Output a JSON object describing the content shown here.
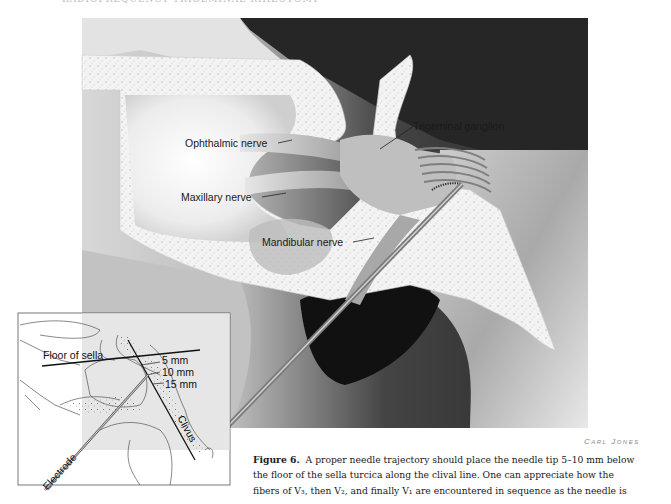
{
  "page": {
    "header_text_truncated": "RADIOFREQUENCY TRIGEMINAL RHIZOTOMY"
  },
  "figure": {
    "number_label": "Figure 6.",
    "illustrator_signature": "Carl Jones",
    "labels": {
      "ophthalmic_nerve": "Ophthalmic nerve",
      "maxillary_nerve": "Maxillary nerve",
      "trigeminal_ganglion": "Trigeminal ganglion",
      "mandibular_nerve": "Mandibular nerve"
    },
    "inset": {
      "floor_of_sella": "Floor of sella",
      "depth_marks": [
        "5  mm",
        "10  mm",
        "15  mm"
      ],
      "clivus": "Clivus",
      "electrode": "Electrode"
    },
    "colors": {
      "dark_background": "#2a2a2a",
      "bone_fill": "#f4f4f4",
      "soft_tissue": "#c8c8c8",
      "inset_shade": "#d9d9d9",
      "needle": "#8c8c8c"
    }
  },
  "caption": {
    "lines": [
      "A proper needle trajectory should place the needle tip 5–10 mm below",
      "the floor of the sella turcica along the clival line. One can appreciate how the",
      "fibers of V₃, then V₂, and finally V₁ are encountered in sequence as the needle is"
    ]
  }
}
